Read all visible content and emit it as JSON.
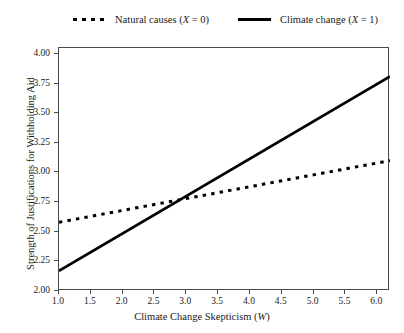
{
  "chart_data": {
    "type": "line",
    "title": "",
    "xlabel": "Climate Change Skepticism (W)",
    "ylabel": "Strength of Justifications for Withholding Aid",
    "xlim": [
      1.0,
      6.2
    ],
    "ylim": [
      2.0,
      4.05
    ],
    "grid": false,
    "legend_position": "top",
    "xticks": [
      "1.0",
      "1.5",
      "2.0",
      "2.5",
      "3.0",
      "3.5",
      "4.0",
      "4.5",
      "5.0",
      "5.5",
      "6.0"
    ],
    "xtick_values": [
      1.0,
      1.5,
      2.0,
      2.5,
      3.0,
      3.5,
      4.0,
      4.5,
      5.0,
      5.5,
      6.0
    ],
    "yticks": [
      "2.00",
      "2.25",
      "2.50",
      "2.75",
      "3.00",
      "3.25",
      "3.50",
      "3.75",
      "4.00"
    ],
    "ytick_values": [
      2.0,
      2.25,
      2.5,
      2.75,
      3.0,
      3.25,
      3.5,
      3.75,
      4.0
    ],
    "series": [
      {
        "name": "Natural causes (X = 0)",
        "label_text": "Natural causes (",
        "label_italic": "X",
        "label_tail": " = 0)",
        "style": "dotted",
        "color": "#000000",
        "x": [
          1.0,
          6.2
        ],
        "values": [
          2.58,
          3.1
        ]
      },
      {
        "name": "Climate change (X = 1)",
        "label_text": "Climate change (",
        "label_italic": "X",
        "label_tail": " = 1)",
        "style": "solid",
        "color": "#000000",
        "x": [
          1.0,
          6.2
        ],
        "values": [
          2.17,
          3.81
        ]
      }
    ],
    "annotations": [
      {
        "note": "Lines intersect near W = 2.85, y = 2.78"
      }
    ]
  },
  "axis_title_x_prefix": "Climate Change Skepticism (",
  "axis_title_x_italic": "W",
  "axis_title_x_suffix": ")",
  "axis_title_y": "Strength of Justifications for Withholding Aid"
}
